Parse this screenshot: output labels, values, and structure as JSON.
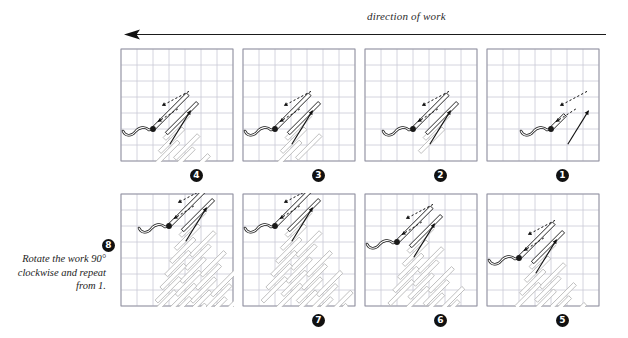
{
  "header": {
    "direction_label": "direction of work",
    "arrow_direction": "left"
  },
  "note": {
    "line1": "Rotate the work 90°",
    "line2": "clockwise and repeat",
    "line3": "from 1."
  },
  "colors": {
    "grid_line": "#c9c9d6",
    "panel_border": "#8e8e9c",
    "active_stitch": "#101010",
    "done_stitch": "#b8b8b8",
    "thread": "#1a1a1a",
    "arrow": "#111111",
    "badge_bg": "#111111",
    "badge_text": "#ffffff"
  },
  "grid": {
    "cols": 7,
    "rows": 7,
    "cell_px": 16
  },
  "panels": [
    {
      "step": "4",
      "label": "❸",
      "row": "top",
      "col": 0,
      "active_stitches": 2,
      "done_stitches": 6,
      "needle_x": 2,
      "needle_y": 5,
      "caption": "4"
    },
    {
      "step": "3",
      "label": "❷",
      "row": "top",
      "col": 1,
      "active_stitches": 2,
      "done_stitches": 4,
      "needle_x": 2,
      "needle_y": 5,
      "caption": "3"
    },
    {
      "step": "2",
      "label": "❶",
      "row": "top",
      "col": 2,
      "active_stitches": 2,
      "done_stitches": 2,
      "needle_x": 3,
      "needle_y": 5,
      "caption": "2"
    },
    {
      "step": "1",
      "label": "❵",
      "row": "top",
      "col": 3,
      "active_stitches": 1,
      "done_stitches": 0,
      "needle_x": 4,
      "needle_y": 5,
      "caption": "1"
    },
    {
      "step": "8",
      "label": "❼",
      "row": "bottom",
      "col": 0,
      "active_stitches": 2,
      "done_stitches": 26,
      "needle_x": 3,
      "needle_y": 2,
      "caption": "8"
    },
    {
      "step": "7",
      "label": "❻",
      "row": "bottom",
      "col": 1,
      "active_stitches": 2,
      "done_stitches": 20,
      "needle_x": 2,
      "needle_y": 2,
      "caption": "7"
    },
    {
      "step": "6",
      "label": "❺",
      "row": "bottom",
      "col": 2,
      "active_stitches": 2,
      "done_stitches": 14,
      "needle_x": 2,
      "needle_y": 3,
      "caption": "6"
    },
    {
      "step": "5",
      "label": "❹",
      "row": "bottom",
      "col": 3,
      "active_stitches": 2,
      "done_stitches": 10,
      "needle_x": 2,
      "needle_y": 4,
      "caption": "5"
    }
  ],
  "captions": {
    "c4": "4",
    "c3": "3",
    "c2": "2",
    "c1": "1",
    "c8": "8",
    "c7": "7",
    "c6": "6",
    "c5": "5"
  }
}
